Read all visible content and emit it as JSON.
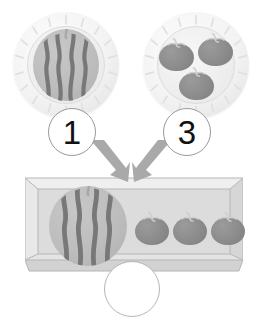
{
  "worksheet": {
    "type": "addition-picture-problem",
    "background_color": "#ffffff",
    "groups": [
      {
        "id": "group-1",
        "label": "Plate with watermelon",
        "count_badge": "1",
        "item": "watermelon",
        "item_count": 1,
        "plate": {
          "x": 13,
          "y": 12,
          "size": 106
        },
        "badge": {
          "x": 48,
          "y": 108,
          "size": 48
        }
      },
      {
        "id": "group-2",
        "label": "Plate with tomatoes",
        "count_badge": "3",
        "item": "tomato",
        "item_count": 3,
        "plate": {
          "x": 143,
          "y": 12,
          "size": 106
        },
        "badge": {
          "x": 163,
          "y": 108,
          "size": 48
        }
      }
    ],
    "tray": {
      "label": "Combined tray",
      "x": 25,
      "y": 172,
      "width": 218,
      "height": 101,
      "contents": [
        {
          "item": "watermelon",
          "count": 1
        },
        {
          "item": "tomato",
          "count": 3
        }
      ]
    },
    "answer_blank": {
      "label": "Answer circle",
      "value": "",
      "x": 104,
      "y": 261,
      "size": 56
    },
    "arrows": [
      {
        "id": "arrow-left",
        "direction": "down-right",
        "from": "group-1",
        "to": "tray"
      },
      {
        "id": "arrow-right",
        "direction": "down-left",
        "from": "group-2",
        "to": "tray"
      }
    ],
    "colors": {
      "plate_rim": "#f3f3f3",
      "plate_face": "#eeeeee",
      "plate_edge": "#dcdcdc",
      "melon_body": "#bdbdbd",
      "melon_stripe": "#787878",
      "melon_stem": "#a8a8a8",
      "tomato_body": "#8d8d8d",
      "tomato_stem": "#cfcfcf",
      "tray_face": "#dcdcdc",
      "tray_rim_light": "#efefef",
      "tray_rim_dark": "#c9c9c9",
      "tray_line": "#b6b6b6",
      "arrow_fill": "#a9a9a9",
      "badge_border": "#9a9a9a",
      "badge_text": "#111111",
      "answer_border": "#b4b4b4"
    }
  }
}
